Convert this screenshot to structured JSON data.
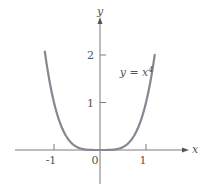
{
  "chart_data": {
    "type": "line",
    "title": "",
    "xlabel": "x",
    "ylabel": "y",
    "function": "y = x^4",
    "annotation": {
      "text_base": "y = x",
      "text_sup": "4",
      "x": 0.45,
      "y": 1.55
    },
    "x_ticks": [
      {
        "value": -1,
        "label": "-1"
      },
      {
        "value": 0,
        "label": "0"
      },
      {
        "value": 1,
        "label": "1"
      }
    ],
    "y_ticks": [
      {
        "value": 1,
        "label": "1"
      },
      {
        "value": 2,
        "label": "2"
      }
    ],
    "xlim": [
      -1.85,
      1.9
    ],
    "ylim": [
      -0.85,
      2.9
    ],
    "grid": false,
    "legend": false,
    "series": [
      {
        "name": "y = x^4",
        "x": [
          -1.2,
          -1.1,
          -1.0,
          -0.9,
          -0.8,
          -0.7,
          -0.6,
          -0.5,
          -0.4,
          -0.3,
          -0.2,
          -0.1,
          0,
          0.1,
          0.2,
          0.3,
          0.4,
          0.5,
          0.6,
          0.7,
          0.8,
          0.9,
          1.0,
          1.1,
          1.19
        ],
        "values": [
          2.07,
          1.46,
          1.0,
          0.66,
          0.41,
          0.24,
          0.13,
          0.06,
          0.03,
          0.01,
          0.0,
          0.0,
          0.0,
          0.0,
          0.0,
          0.01,
          0.03,
          0.06,
          0.13,
          0.24,
          0.41,
          0.66,
          1.0,
          1.46,
          2.0
        ],
        "color": "#8a8590"
      }
    ]
  }
}
